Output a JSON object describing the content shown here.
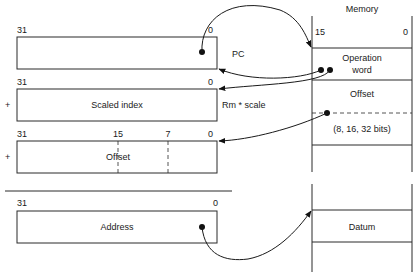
{
  "registers": [
    {
      "id": "pc",
      "label": "",
      "side_label": "PC",
      "prefix": "",
      "bit_labels": [
        "31",
        "0"
      ]
    },
    {
      "id": "scaled-index",
      "label": "Scaled index",
      "side_label": "Rm * scale",
      "prefix": "+",
      "bit_labels": [
        "31",
        "0"
      ]
    },
    {
      "id": "offset",
      "label": "Offset",
      "side_label": "",
      "prefix": "+",
      "bit_labels": [
        "31",
        "15",
        "7",
        "0"
      ]
    },
    {
      "id": "address",
      "label": "Address",
      "side_label": "",
      "prefix": "",
      "bit_labels": [
        "31",
        "0"
      ]
    }
  ],
  "memory": {
    "title": "Memory",
    "bit_labels": [
      "15",
      "0"
    ],
    "cells": [
      {
        "id": "operation-word",
        "lines": [
          "Operation",
          "word"
        ]
      },
      {
        "id": "offset",
        "lines": [
          "Offset",
          "(8, 16, 32 bits)"
        ]
      },
      {
        "id": "datum",
        "lines": [
          "Datum"
        ]
      }
    ]
  },
  "arrows": [
    {
      "from": "pc",
      "to": "memory.operation-word"
    },
    {
      "from": "memory.operation-word",
      "to": "pc"
    },
    {
      "from": "memory.operation-word",
      "to": "scaled-index"
    },
    {
      "from": "memory.offset",
      "to": "offset"
    },
    {
      "from": "address",
      "to": "memory.datum"
    }
  ]
}
